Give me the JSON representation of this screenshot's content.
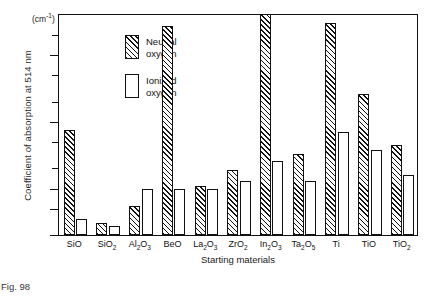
{
  "figure": {
    "caption": "Fig. 98",
    "units_prefix": "(cm",
    "units_exponent": "-1",
    "units_suffix": ")"
  },
  "chart_data": {
    "type": "bar",
    "title": "",
    "xlabel": "Starting materials",
    "ylabel": "Coefficient of absorption at 514 nm",
    "yunits": "(cm-1)",
    "yscale": "log",
    "ylim": [
      2,
      4200
    ],
    "grid": false,
    "legend_position": "top-left",
    "ytick_values": [
      2,
      5,
      10,
      100,
      1000
    ],
    "ytick_labels": [
      "2",
      "5",
      "10",
      "100",
      "1000"
    ],
    "yminor_ticks": [
      20,
      50,
      200,
      500,
      2000
    ],
    "categories": [
      "SiO",
      "SiO2",
      "Al2O3",
      "BeO",
      "La2O3",
      "ZrO2",
      "In2O3",
      "Ta2O5",
      "Ti",
      "TiO",
      "TiO2"
    ],
    "category_labels": [
      {
        "base": "SiO",
        "parts": [
          {
            "t": "SiO"
          }
        ]
      },
      {
        "base": "SiO2",
        "parts": [
          {
            "t": "SiO"
          },
          {
            "t": "2",
            "sub": true
          }
        ]
      },
      {
        "base": "Al2O3",
        "parts": [
          {
            "t": "Al"
          },
          {
            "t": "2",
            "sub": true
          },
          {
            "t": "O"
          },
          {
            "t": "3",
            "sub": true
          }
        ]
      },
      {
        "base": "BeO",
        "parts": [
          {
            "t": "BeO"
          }
        ]
      },
      {
        "base": "La2O3",
        "parts": [
          {
            "t": "La"
          },
          {
            "t": "2",
            "sub": true
          },
          {
            "t": "O"
          },
          {
            "t": "3",
            "sub": true
          }
        ]
      },
      {
        "base": "ZrO2",
        "parts": [
          {
            "t": "ZrO"
          },
          {
            "t": "2",
            "sub": true
          }
        ]
      },
      {
        "base": "In2O3",
        "parts": [
          {
            "t": "In"
          },
          {
            "t": "2",
            "sub": true
          },
          {
            "t": "O"
          },
          {
            "t": "3",
            "sub": true
          }
        ]
      },
      {
        "base": "Ta2O5",
        "parts": [
          {
            "t": "Ta"
          },
          {
            "t": "2",
            "sub": true
          },
          {
            "t": "O"
          },
          {
            "t": "5",
            "sub": true
          }
        ]
      },
      {
        "base": "Ti",
        "parts": [
          {
            "t": "Ti"
          }
        ]
      },
      {
        "base": "TiO",
        "parts": [
          {
            "t": "TiO"
          }
        ]
      },
      {
        "base": "TiO2",
        "parts": [
          {
            "t": "TiO"
          },
          {
            "t": "2",
            "sub": true
          }
        ]
      }
    ],
    "series": [
      {
        "name": "Neutral oxygen",
        "fill": "hatched",
        "color": "#111111",
        "values": [
          75,
          3.0,
          5.5,
          2700,
          11,
          19,
          4100,
          33,
          3000,
          260,
          45
        ]
      },
      {
        "name": "Ionized oxygen",
        "fill": "white",
        "color": "#ffffff",
        "values": [
          3.5,
          2.7,
          9.8,
          9.7,
          9.7,
          13,
          26,
          13,
          70,
          37,
          16
        ]
      }
    ]
  },
  "legend": {
    "items": [
      {
        "label_line1": "Neutral",
        "label_line2": "oxygen",
        "fill": "hatched"
      },
      {
        "label_line1": "Ionized",
        "label_line2": "oxygen",
        "fill": "white"
      }
    ]
  }
}
